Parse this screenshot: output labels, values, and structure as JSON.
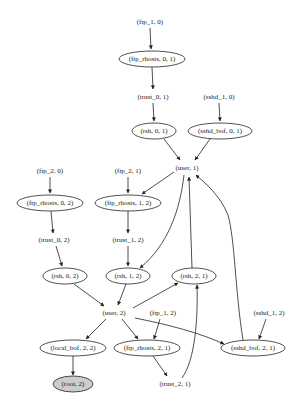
{
  "graph": {
    "nodes": [
      {
        "id": "ftp_1_0",
        "label": "(ftp_1, 0)",
        "shape": "plaintext",
        "x": 150,
        "y": 22
      },
      {
        "id": "ftp_rhosts_0_1",
        "label": "(ftp_rhosts, 0, 1)",
        "shape": "ellipse",
        "x": 152,
        "y": 59,
        "rx": 33,
        "ry": 8
      },
      {
        "id": "trust_0_1",
        "label": "(trust_0, 1)",
        "shape": "plaintext",
        "x": 153,
        "y": 97
      },
      {
        "id": "sshd_1_0",
        "label": "(sshd_1, 0)",
        "shape": "plaintext",
        "x": 219,
        "y": 97
      },
      {
        "id": "rsh_0_1",
        "label": "(rsh, 0, 1)",
        "shape": "ellipse",
        "x": 154,
        "y": 131,
        "rx": 22,
        "ry": 8
      },
      {
        "id": "sshd_bof_0_1",
        "label": "(sshd_bof, 0, 1)",
        "shape": "ellipse",
        "x": 220,
        "y": 131,
        "rx": 32,
        "ry": 8
      },
      {
        "id": "user_1",
        "label": "(user, 1)",
        "shape": "plaintext",
        "x": 187,
        "y": 168
      },
      {
        "id": "ftp_2_0",
        "label": "(ftp_2, 0)",
        "shape": "plaintext",
        "x": 50,
        "y": 171
      },
      {
        "id": "ftp_2_1",
        "label": "(ftp_2, 1)",
        "shape": "plaintext",
        "x": 128,
        "y": 171
      },
      {
        "id": "ftp_rhosts_0_2",
        "label": "(ftp_rhosts, 0, 2)",
        "shape": "ellipse",
        "x": 50,
        "y": 203,
        "rx": 33,
        "ry": 8
      },
      {
        "id": "ftp_rhosts_1_2",
        "label": "(ftp_rhosts, 1, 2)",
        "shape": "ellipse",
        "x": 128,
        "y": 203,
        "rx": 33,
        "ry": 8
      },
      {
        "id": "trust_0_2",
        "label": "(trust_0, 2)",
        "shape": "plaintext",
        "x": 54,
        "y": 240
      },
      {
        "id": "trust_1_2",
        "label": "(trust_1, 2)",
        "shape": "plaintext",
        "x": 128,
        "y": 240
      },
      {
        "id": "rsh_0_2",
        "label": "(rsh, 0, 2)",
        "shape": "ellipse",
        "x": 65,
        "y": 276,
        "rx": 22,
        "ry": 8
      },
      {
        "id": "rsh_1_2",
        "label": "(rsh, 1, 2)",
        "shape": "ellipse",
        "x": 128,
        "y": 276,
        "rx": 22,
        "ry": 8
      },
      {
        "id": "rsh_2_1",
        "label": "(rsh, 2, 1)",
        "shape": "ellipse",
        "x": 194,
        "y": 276,
        "rx": 22,
        "ry": 8
      },
      {
        "id": "user_2",
        "label": "(user, 2)",
        "shape": "plaintext",
        "x": 114,
        "y": 313
      },
      {
        "id": "ftp_1_2",
        "label": "(ftp_1, 2)",
        "shape": "plaintext",
        "x": 163,
        "y": 313
      },
      {
        "id": "sshd_1_2",
        "label": "(sshd_1, 2)",
        "shape": "plaintext",
        "x": 269,
        "y": 313
      },
      {
        "id": "local_bof_2_2",
        "label": "(local_bof, 2, 2)",
        "shape": "ellipse",
        "x": 73,
        "y": 348,
        "rx": 33,
        "ry": 8
      },
      {
        "id": "ftp_rhosts_2_1",
        "label": "(ftp_rhosts, 2, 1)",
        "shape": "ellipse",
        "x": 147,
        "y": 348,
        "rx": 33,
        "ry": 8
      },
      {
        "id": "sshd_bof_2_1",
        "label": "(sshd_bof, 2, 1)",
        "shape": "ellipse",
        "x": 253,
        "y": 348,
        "rx": 32,
        "ry": 8
      },
      {
        "id": "root_2",
        "label": "(root, 2)",
        "shape": "ellipse-filled",
        "x": 73,
        "y": 384,
        "rx": 20,
        "ry": 8
      },
      {
        "id": "trust_2_1",
        "label": "(trust_2, 1)",
        "shape": "plaintext",
        "x": 175,
        "y": 384
      }
    ],
    "edges": [
      {
        "from": "ftp_1_0",
        "to": "ftp_rhosts_0_1",
        "d": "M150,28 L151,49"
      },
      {
        "from": "ftp_rhosts_0_1",
        "to": "trust_0_1",
        "d": "M152,67 L153,89"
      },
      {
        "from": "trust_0_1",
        "to": "rsh_0_1",
        "d": "M153,103 L154,121"
      },
      {
        "from": "sshd_1_0",
        "to": "sshd_bof_0_1",
        "d": "M219,103 L220,121"
      },
      {
        "from": "rsh_0_1",
        "to": "user_1",
        "d": "M164,139 L180,160"
      },
      {
        "from": "sshd_bof_0_1",
        "to": "user_1",
        "d": "M210,139 L195,160"
      },
      {
        "from": "ftp_2_0",
        "to": "ftp_rhosts_0_2",
        "d": "M50,177 L50,193"
      },
      {
        "from": "ftp_2_1",
        "to": "ftp_rhosts_1_2",
        "d": "M128,177 L128,193"
      },
      {
        "from": "user_1",
        "to": "ftp_rhosts_1_2",
        "d": "M174,172 L142,194"
      },
      {
        "from": "ftp_rhosts_0_2",
        "to": "trust_0_2",
        "d": "M51,211 L53,233"
      },
      {
        "from": "ftp_rhosts_1_2",
        "to": "trust_1_2",
        "d": "M128,211 L128,233"
      },
      {
        "from": "trust_0_2",
        "to": "rsh_0_2",
        "d": "M56,246 L62,266"
      },
      {
        "from": "trust_1_2",
        "to": "rsh_1_2",
        "d": "M128,246 L128,266"
      },
      {
        "from": "user_1",
        "to": "rsh_1_2",
        "d": "M184,175 C180,210 168,245 140,268"
      },
      {
        "from": "rsh_2_1",
        "to": "user_1",
        "d": "M192,268 L189,177"
      },
      {
        "from": "sshd_bof_2_1",
        "to": "user_1",
        "d": "M243,340 C235,290 235,240 228,215 C220,195 205,183 196,175"
      },
      {
        "from": "rsh_0_2",
        "to": "user_2",
        "d": "M74,284 L104,306"
      },
      {
        "from": "rsh_1_2",
        "to": "user_2",
        "d": "M126,284 L118,305"
      },
      {
        "from": "user_2",
        "to": "rsh_2_1",
        "d": "M133,308 L178,283"
      },
      {
        "from": "user_2",
        "to": "local_bof_2_2",
        "d": "M106,319 L86,339"
      },
      {
        "from": "user_2",
        "to": "ftp_rhosts_2_1",
        "d": "M122,319 L138,339"
      },
      {
        "from": "user_2",
        "to": "sshd_bof_2_1",
        "d": "M135,318 C170,325 200,333 224,344"
      },
      {
        "from": "ftp_1_2",
        "to": "ftp_rhosts_2_1",
        "d": "M160,319 L154,339"
      },
      {
        "from": "sshd_1_2",
        "to": "sshd_bof_2_1",
        "d": "M266,319 L259,339"
      },
      {
        "from": "ftp_rhosts_2_1",
        "to": "trust_2_1",
        "d": "M153,356 L167,376"
      },
      {
        "from": "trust_2_1",
        "to": "rsh_2_1",
        "d": "M182,378 C195,360 198,320 197,285"
      },
      {
        "from": "local_bof_2_2",
        "to": "root_2",
        "d": "M73,356 L73,375"
      }
    ]
  },
  "colors": {
    "stroke": "#222222",
    "goal_fill": "#cccccc",
    "background": "#ffffff"
  }
}
